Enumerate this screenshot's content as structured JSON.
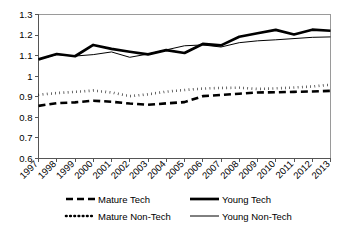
{
  "chart_data": {
    "type": "line",
    "title": "",
    "xlabel": "",
    "ylabel": "",
    "xlim": [
      1997,
      2013
    ],
    "ylim": [
      0.6,
      1.3
    ],
    "ytick_step": 0.1,
    "grid": false,
    "legend_position": "bottom",
    "categories": [
      1997,
      1998,
      1999,
      2000,
      2001,
      2002,
      2003,
      2004,
      2005,
      2006,
      2007,
      2008,
      2009,
      2010,
      2011,
      2012,
      2013
    ],
    "xtick_labels": [
      "1997",
      "1998",
      "1999",
      "2000",
      "2001",
      "2002",
      "2003",
      "2004",
      "2005",
      "2006",
      "2007",
      "2008",
      "2009",
      "2010",
      "2011",
      "2012",
      "2013"
    ],
    "ytick_labels": [
      "0.6",
      "0.7",
      "0.8",
      "0.9",
      "1",
      "1.1",
      "1.2",
      "1.3"
    ],
    "ytick_values": [
      0.6,
      0.7,
      0.8,
      0.9,
      1.0,
      1.1,
      1.2,
      1.3
    ],
    "series": [
      {
        "name": "Mature Tech",
        "style": "dashed",
        "color": "#000000",
        "width": 2.6,
        "dasharray": "7,4",
        "values": [
          0.856,
          0.869,
          0.873,
          0.881,
          0.876,
          0.867,
          0.861,
          0.868,
          0.874,
          0.903,
          0.909,
          0.915,
          0.921,
          0.922,
          0.924,
          0.926,
          0.929
        ]
      },
      {
        "name": "Young Tech",
        "style": "solid-thick",
        "color": "#000000",
        "width": 2.7,
        "dasharray": "none",
        "values": [
          1.082,
          1.108,
          1.097,
          1.152,
          1.133,
          1.119,
          1.106,
          1.127,
          1.113,
          1.157,
          1.15,
          1.192,
          1.209,
          1.225,
          1.203,
          1.226,
          1.221
        ]
      },
      {
        "name": "Mature Non-Tech",
        "style": "dotted",
        "color": "#000000",
        "width": 2.6,
        "dasharray": "0.6,3.6",
        "values": [
          0.91,
          0.918,
          0.924,
          0.93,
          0.921,
          0.903,
          0.912,
          0.925,
          0.933,
          0.94,
          0.943,
          0.944,
          0.938,
          0.941,
          0.945,
          0.95,
          0.959
        ]
      },
      {
        "name": "Young Non-Tech",
        "style": "solid-thin",
        "color": "#000000",
        "width": 1,
        "dasharray": "none",
        "values": [
          1.082,
          1.105,
          1.098,
          1.105,
          1.118,
          1.092,
          1.108,
          1.128,
          1.148,
          1.152,
          1.142,
          1.163,
          1.172,
          1.177,
          1.183,
          1.189,
          1.191
        ]
      }
    ],
    "legend": [
      {
        "label": "Mature Tech",
        "style": "dashed"
      },
      {
        "label": "Young Tech",
        "style": "solid-thick"
      },
      {
        "label": "Mature Non-Tech",
        "style": "dotted"
      },
      {
        "label": "Young Non-Tech",
        "style": "solid-thin"
      }
    ]
  }
}
